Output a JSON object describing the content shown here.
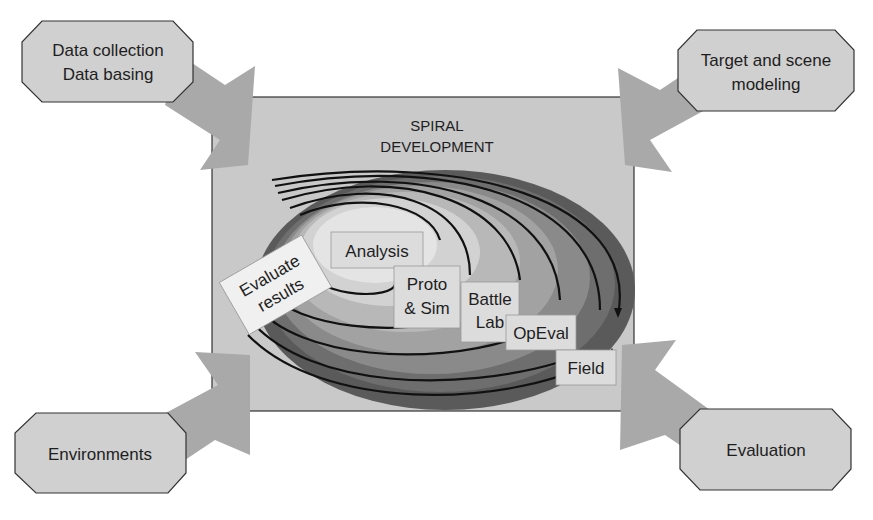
{
  "diagram": {
    "title_line1": "SPIRAL",
    "title_line2": "DEVELOPMENT",
    "corner_boxes": {
      "top_left": {
        "line1": "Data collection",
        "line2": "Data basing"
      },
      "top_right": {
        "line1": "Target and scene",
        "line2": "modeling"
      },
      "bottom_left": {
        "line1": "Environments"
      },
      "bottom_right": {
        "line1": "Evaluation"
      }
    },
    "stages": {
      "evaluate": {
        "line1": "Evaluate",
        "line2": "results"
      },
      "analysis": {
        "line1": "Analysis"
      },
      "proto": {
        "line1": "Proto",
        "line2": "& Sim"
      },
      "battle": {
        "line1": "Battle",
        "line2": "Lab"
      },
      "opeval": {
        "line1": "OpEval"
      },
      "field": {
        "line1": "Field"
      }
    },
    "colors": {
      "panel": "#c9c9c9",
      "box": "#d0d0d0",
      "arrow": "#a9a9a9",
      "ring_outer": "#5a5a5a",
      "ring_mid": "#8a8a8a",
      "ring_light": "#b8b8b8",
      "ring_center": "#e4e4e4",
      "label_box": "#dcdcdc",
      "evaluate_box": "#f0f0f0"
    }
  }
}
